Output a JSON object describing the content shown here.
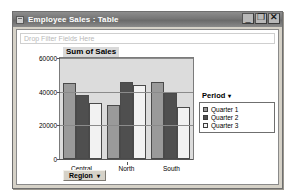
{
  "window": {
    "title": "Employee Sales : Table",
    "icon": "table-window-icon",
    "controls": {
      "minimize": "_",
      "maximize": "❐",
      "close": "✕"
    }
  },
  "filter_zone": {
    "placeholder": "Drop Filter Fields Here"
  },
  "field_buttons": {
    "region": {
      "label": "Region",
      "caret": "▾"
    }
  },
  "legend": {
    "title": "Period",
    "caret": "▾",
    "items": [
      {
        "label": "Quarter 1",
        "color": "#9a9a9a"
      },
      {
        "label": "Quarter 2",
        "color": "#4f4f4f"
      },
      {
        "label": "Quarter 3",
        "color": "#f2f2f2"
      }
    ]
  },
  "chart_data": {
    "type": "bar",
    "title": "Sum of Sales",
    "xlabel": "",
    "ylabel": "",
    "categories": [
      "Central",
      "North",
      "South"
    ],
    "series": [
      {
        "name": "Quarter 1",
        "color": "#9a9a9a",
        "values": [
          45000,
          32000,
          46000
        ]
      },
      {
        "name": "Quarter 2",
        "color": "#4f4f4f",
        "values": [
          38000,
          45500,
          39500
        ]
      },
      {
        "name": "Quarter 3",
        "color": "#f2f2f2",
        "values": [
          33000,
          44000,
          31000
        ]
      }
    ],
    "ylim": [
      0,
      60000
    ],
    "yticks": [
      0,
      20000,
      40000,
      60000
    ],
    "ytick_labels": [
      "0",
      "20000",
      "40000",
      "60000"
    ],
    "grid": true,
    "legend_position": "right",
    "plot_background": "#dcdcdc"
  }
}
